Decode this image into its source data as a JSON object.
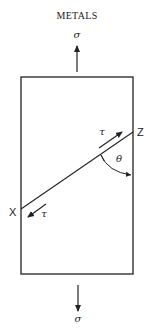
{
  "title": "METALS",
  "labels": {
    "stress_top": "σ",
    "stress_bottom": "σ",
    "shear_upper": "τ",
    "shear_lower": "τ",
    "angle": "θ",
    "point_x": "X",
    "point_z": "Z"
  },
  "colors": {
    "ink": "#222222",
    "background": "#ffffff"
  }
}
